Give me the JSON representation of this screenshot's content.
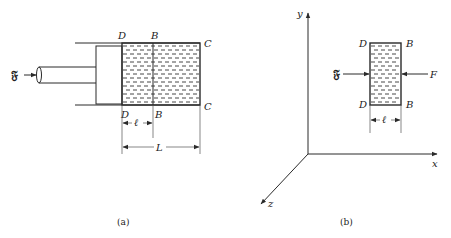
{
  "figure_a": {
    "caption": "(a)",
    "force_label": "𝔉",
    "top_labels": [
      "D",
      "B",
      "C"
    ],
    "bottom_labels": [
      "D",
      "B",
      "C"
    ],
    "dim_small": "ℓ",
    "dim_large": "L"
  },
  "figure_b": {
    "caption": "(b)",
    "axis_labels": {
      "x": "x",
      "y": "y",
      "z": "z"
    },
    "force_left_label": "𝔉",
    "force_right_label": "F",
    "top_labels": [
      "D",
      "B"
    ],
    "bottom_labels": [
      "D",
      "B"
    ],
    "dim_small": "ℓ"
  },
  "colors": {
    "ink": "#2a2a2a",
    "background": "#ffffff"
  }
}
